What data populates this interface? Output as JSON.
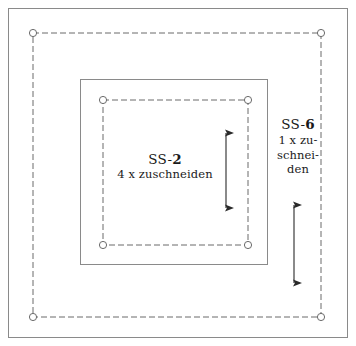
{
  "sheet": {
    "title": "Schnittmuster Teile SS-2 und SS-6",
    "background_color": "#ffffff",
    "frame_color": "#808080",
    "line_color": "#555555",
    "dash_color": "#6b6b6b",
    "text_color": "#1a1a1a"
  },
  "pieces": [
    {
      "id": "ss-2",
      "code_prefix": "SS-",
      "code_number": "2",
      "quantity_text": "4 x zuschneiden",
      "grain_arrow": "double-headed-vertical"
    },
    {
      "id": "ss-6",
      "code_prefix": "SS-",
      "code_number": "6",
      "quantity_lines": [
        "1 x zu-",
        "schnei-",
        "den"
      ],
      "grain_arrow": "double-headed-vertical"
    }
  ],
  "geometry": {
    "outer_frame": {
      "x": 8,
      "y": 8,
      "width": 340,
      "height": 330
    },
    "outer_cut_square": {
      "x": 33,
      "y": 33,
      "width": 288,
      "height": 284
    },
    "inner_solid_square": {
      "x": 80,
      "y": 79,
      "width": 188,
      "height": 186
    },
    "inner_cut_square": {
      "x": 103,
      "y": 100,
      "width": 145,
      "height": 145
    },
    "corner_marker_radius": 3.6,
    "dash_pattern": "6 3"
  },
  "markers": {
    "outer_corners": [
      {
        "cx": 33,
        "cy": 33
      },
      {
        "cx": 321,
        "cy": 33
      },
      {
        "cx": 33,
        "cy": 317
      },
      {
        "cx": 321,
        "cy": 317
      }
    ],
    "inner_corners": [
      {
        "cx": 103,
        "cy": 100
      },
      {
        "cx": 248,
        "cy": 100
      },
      {
        "cx": 103,
        "cy": 245
      },
      {
        "cx": 248,
        "cy": 245
      }
    ]
  },
  "arrows": [
    {
      "id": "grain-arrow-ss2",
      "x": 226,
      "y_top": 126,
      "y_bottom": 215
    },
    {
      "id": "grain-arrow-ss6",
      "x": 294,
      "y_top": 198,
      "y_bottom": 290
    }
  ]
}
